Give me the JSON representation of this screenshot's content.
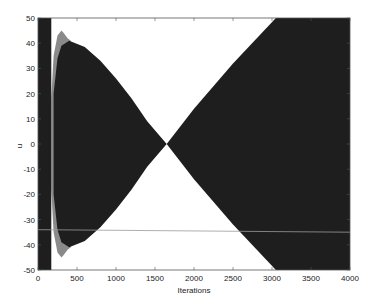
{
  "chart_data": {
    "type": "area",
    "title": "",
    "xlabel": "Iterations",
    "ylabel": "u",
    "xlim": [
      0,
      4000
    ],
    "ylim": [
      -50,
      50
    ],
    "xticks": [
      0,
      500,
      1000,
      1500,
      2000,
      2500,
      3000,
      3500,
      4000
    ],
    "yticks": [
      -50,
      -40,
      -30,
      -20,
      -10,
      0,
      10,
      20,
      30,
      40,
      50
    ],
    "grid": false,
    "legend": null,
    "colors": {
      "dark_fill": "#1e1e1e",
      "grey_fill": "#8a8a8a",
      "axes": "#555555",
      "line": "#9a9a9a"
    },
    "series": [
      {
        "name": "initial dense band",
        "style": "dark",
        "x": [
          0,
          170
        ],
        "upper": [
          50,
          50
        ],
        "lower": [
          -50,
          -50
        ]
      },
      {
        "name": "grey envelope (transient)",
        "style": "grey",
        "x": [
          170,
          200,
          250,
          300,
          330,
          380,
          420
        ],
        "upper": [
          18,
          35,
          43,
          45,
          44,
          42,
          41
        ],
        "lower": [
          -18,
          -35,
          -43,
          -45,
          -44,
          -42,
          -41
        ]
      },
      {
        "name": "dark envelope (contracting)",
        "style": "dark",
        "x": [
          200,
          250,
          300,
          400,
          600,
          800,
          1000,
          1200,
          1400,
          1650
        ],
        "upper": [
          20,
          34,
          39,
          41,
          38.5,
          33,
          26,
          18,
          9,
          0
        ],
        "lower": [
          -20,
          -34,
          -39,
          -41,
          -38.5,
          -33,
          -26,
          -18,
          -9,
          0
        ]
      },
      {
        "name": "dark envelope (expanding)",
        "style": "dark",
        "x": [
          1650,
          2000,
          2500,
          3050,
          4000
        ],
        "upper": [
          0,
          14,
          32,
          50,
          50
        ],
        "lower": [
          0,
          -14,
          -32,
          -50,
          -50
        ]
      },
      {
        "name": "horizontal trace",
        "style": "line",
        "x": [
          0,
          4000
        ],
        "y": [
          -34,
          -35
        ]
      }
    ]
  }
}
